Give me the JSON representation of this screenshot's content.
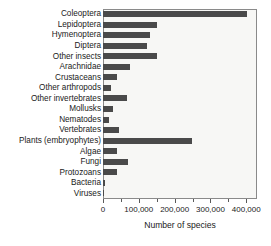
{
  "chart_data": {
    "type": "bar",
    "orientation": "horizontal",
    "title": "",
    "xlabel": "Number of species",
    "ylabel": "",
    "xlim": [
      0,
      430000
    ],
    "xticks": [
      0,
      100000,
      200000,
      300000,
      400000
    ],
    "xtick_labels": [
      "0",
      "100,000",
      "200,000",
      "300,000",
      "400,000"
    ],
    "minor_tick_interval": 50000,
    "grid": false,
    "legend": false,
    "bar_color": "#4a4a4a",
    "plot_background": "#f7f7f5",
    "frame_color": "#8a8a8a",
    "categories": [
      "Coleoptera",
      "Lepidoptera",
      "Hymenoptera",
      "Diptera",
      "Other insects",
      "Arachnidae",
      "Crustaceans",
      "Other arthropods",
      "Other invertebrates",
      "Mollusks",
      "Nematodes",
      "Vertebrates",
      "Plants (embryophytes)",
      "Algae",
      "Fungi",
      "Protozoans",
      "Bacteria",
      "Viruses"
    ],
    "values": [
      403000,
      150000,
      130000,
      122000,
      152000,
      75000,
      40000,
      21000,
      67000,
      29000,
      16000,
      45000,
      248000,
      40000,
      70000,
      40000,
      5000,
      4000
    ]
  }
}
